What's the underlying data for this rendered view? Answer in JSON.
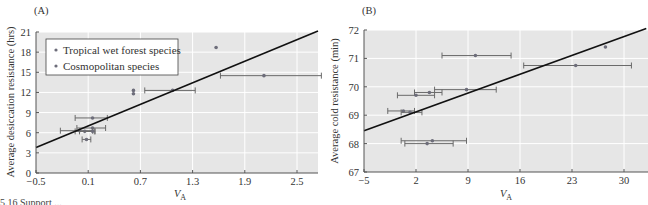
{
  "caption_fragment": "5.16    Support ... ",
  "colors": {
    "plot_bg": "#e6e6e6",
    "grid": "#ffffff",
    "point": "#6d6d7a",
    "errorbar": "#6a6a6a",
    "fit_line": "#111111",
    "axis": "#555555"
  },
  "chart_data": [
    {
      "id": "A",
      "type": "scatter",
      "panel_label": "(A)",
      "title": "",
      "xlabel": "V",
      "xlabel_sub": "A",
      "ylabel": "Average desiccation resistance (hrs)",
      "xlim": [
        -0.5,
        2.75
      ],
      "ylim": [
        0,
        21
      ],
      "xticks": [
        -0.5,
        0.1,
        0.7,
        1.3,
        1.9,
        2.5
      ],
      "xtick_labels": [
        "−0.5",
        "0.1",
        "0.7",
        "1.3",
        "1.9",
        "2.5"
      ],
      "yticks": [
        0,
        3,
        6,
        9,
        12,
        15,
        18,
        21
      ],
      "ytick_labels": [
        "0",
        "3",
        "6",
        "9",
        "12",
        "15",
        "18",
        "21"
      ],
      "grid": true,
      "legend": {
        "placement": "top-left",
        "entries": [
          "Tropical wet forest species",
          "Cosmopolitan species"
        ]
      },
      "fit_line": {
        "x": [
          -0.5,
          2.75
        ],
        "y": [
          3.8,
          21.2
        ]
      },
      "points": [
        {
          "x": 0.62,
          "y": 12.3,
          "xerr": null
        },
        {
          "x": 0.62,
          "y": 11.8,
          "xerr": null
        },
        {
          "x": 1.07,
          "y": 12.3,
          "xerr": [
            0.75,
            1.33
          ]
        },
        {
          "x": 1.57,
          "y": 18.7,
          "xerr": null
        },
        {
          "x": 2.12,
          "y": 14.5,
          "xerr": [
            1.62,
            2.78
          ]
        },
        {
          "x": 0.15,
          "y": 8.2,
          "xerr": [
            -0.05,
            0.32
          ]
        },
        {
          "x": 0.15,
          "y": 6.7,
          "xerr": [
            -0.03,
            0.3
          ]
        },
        {
          "x": 0.0,
          "y": 6.3,
          "xerr": [
            -0.22,
            0.15
          ]
        },
        {
          "x": 0.06,
          "y": 6.2,
          "xerr": [
            -0.05,
            0.17
          ]
        },
        {
          "x": 0.15,
          "y": 6.2,
          "xerr": [
            0.0,
            0.18
          ]
        },
        {
          "x": 0.08,
          "y": 5.0,
          "xerr": [
            0.03,
            0.13
          ]
        }
      ]
    },
    {
      "id": "B",
      "type": "scatter",
      "panel_label": "(B)",
      "title": "",
      "xlabel": "V",
      "xlabel_sub": "A",
      "ylabel": "Average cold resistance (min)",
      "xlim": [
        -5,
        33
      ],
      "ylim": [
        67,
        72
      ],
      "xticks": [
        -5,
        2,
        9,
        16,
        23,
        30
      ],
      "xtick_labels": [
        "−5",
        "2",
        "9",
        "16",
        "23",
        "30"
      ],
      "yticks": [
        67,
        68,
        69,
        70,
        71,
        72
      ],
      "ytick_labels": [
        "67",
        "68",
        "69",
        "70",
        "71",
        "72"
      ],
      "grid": true,
      "legend": null,
      "fit_line": {
        "x": [
          -5,
          33
        ],
        "y": [
          68.45,
          72.05
        ]
      },
      "points": [
        {
          "x": 10.0,
          "y": 71.1,
          "xerr": [
            5.5,
            14.8
          ]
        },
        {
          "x": 27.5,
          "y": 71.4,
          "xerr": null
        },
        {
          "x": 23.5,
          "y": 70.75,
          "xerr": [
            16.5,
            31.0
          ]
        },
        {
          "x": 8.8,
          "y": 69.9,
          "xerr": [
            4.5,
            12.8
          ]
        },
        {
          "x": 3.8,
          "y": 69.8,
          "xerr": [
            1.8,
            5.5
          ]
        },
        {
          "x": 2.0,
          "y": 69.7,
          "xerr": [
            -0.5,
            4.5
          ]
        },
        {
          "x": 0.3,
          "y": 69.15,
          "xerr": [
            -1.8,
            1.8
          ]
        },
        {
          "x": 1.2,
          "y": 69.1,
          "xerr": [
            0.0,
            2.8
          ]
        },
        {
          "x": 4.2,
          "y": 68.1,
          "xerr": [
            0.0,
            8.8
          ]
        },
        {
          "x": 3.5,
          "y": 68.0,
          "xerr": [
            0.5,
            7.0
          ]
        }
      ]
    }
  ]
}
